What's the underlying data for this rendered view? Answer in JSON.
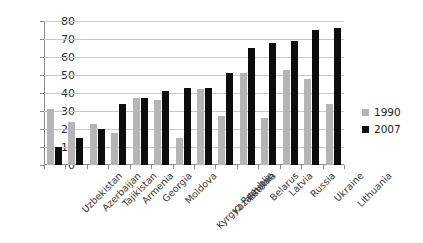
{
  "chart_data": {
    "type": "bar",
    "title": "",
    "subtitle": "",
    "xlabel": "",
    "ylabel": "",
    "ylim": [
      0,
      80
    ],
    "yticks": [
      0,
      10,
      20,
      30,
      40,
      50,
      60,
      70,
      80
    ],
    "grid": true,
    "legend_position": "right",
    "categories": [
      "Uzbekistan",
      "Azerbaijan",
      "Tajikistan",
      "Armenia",
      "Georgia",
      "Moldova",
      "Kyrgyz Republic",
      "Kazakhstan",
      "Estonia",
      "Belarus",
      "Latvia",
      "Russia",
      "Ukraine",
      "Lithuania"
    ],
    "series": [
      {
        "name": "1990",
        "color": "#b5b5b5",
        "values": [
          31,
          24,
          23,
          18,
          37,
          36,
          15,
          42,
          27,
          51,
          26,
          53,
          48,
          34
        ]
      },
      {
        "name": "2007",
        "color": "#0d0d0d",
        "values": [
          10,
          15,
          20,
          34,
          37,
          41,
          43,
          43,
          51,
          65,
          68,
          69,
          75,
          76
        ]
      }
    ]
  },
  "legend": {
    "entries": [
      {
        "label": "1990",
        "color": "#b5b5b5"
      },
      {
        "label": "2007",
        "color": "#0d0d0d"
      }
    ]
  },
  "axis": {
    "y_tick_labels": [
      "80",
      "70",
      "60",
      "50",
      "40",
      "30",
      "20",
      "10",
      "0"
    ]
  }
}
